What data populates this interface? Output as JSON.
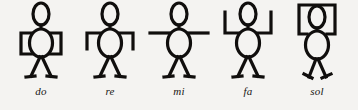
{
  "figure": {
    "background_color": "#f4f3f1",
    "ink_color": "#100e0d",
    "label_style": "italic serif lowercase"
  },
  "signs": [
    {
      "label": "do",
      "name": "sign-do",
      "arms": "elbows out, forearms bent inward to the waist forming square brackets at both sides of the torso",
      "pose_level": "lowest"
    },
    {
      "label": "re",
      "name": "sign-re",
      "arms": "upper arms horizontal from shoulders, forearms bent downward at both ends",
      "pose_level": "low"
    },
    {
      "label": "mi",
      "name": "sign-mi",
      "arms": "both arms straight out horizontally to the sides",
      "pose_level": "middle"
    },
    {
      "label": "fa",
      "name": "sign-fa",
      "arms": "upper arms horizontal from shoulders, forearms bent upward at both ends",
      "pose_level": "high"
    },
    {
      "label": "sol",
      "name": "sign-sol",
      "arms": "both arms raised overhead forming a rectangular frame around the head",
      "pose_level": "highest"
    }
  ]
}
